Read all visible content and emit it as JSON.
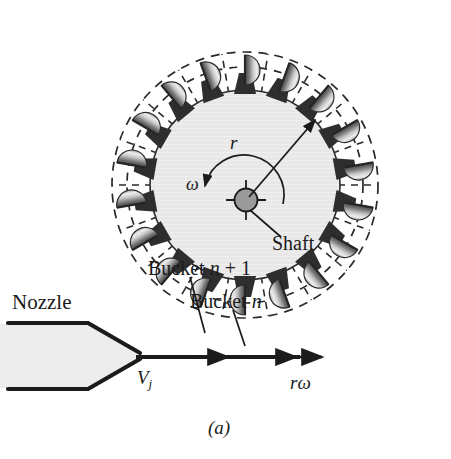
{
  "figure": {
    "caption": "(a)",
    "background_color": "#ffffff"
  },
  "labels": {
    "nozzle": "Nozzle",
    "bucket_n_plus_1": "Bucket n + 1",
    "bucket_n_plus_1_prefix": "Bucket ",
    "bucket_n_plus_1_var": "n",
    "bucket_n_plus_1_suffix": " + 1",
    "bucket_n": "Bucket n",
    "bucket_n_prefix": "Bucket ",
    "bucket_n_var": "n",
    "shaft": "Shaft",
    "radius": "r",
    "angular_velocity": "ω",
    "jet_velocity_symbol": "V",
    "jet_velocity_subscript": "j",
    "blade_speed": "rω"
  },
  "colors": {
    "disc_fill": "#e8e8e8",
    "disc_stroke": "#2a2a2a",
    "bucket_dark": "#3a3a3a",
    "bucket_light": "#f2f2f2",
    "bucket_stem": "#2e2e2e",
    "hub_fill": "#9a9a9a",
    "line": "#1b1b1b",
    "dashed": "#2a2a2a",
    "nozzle_fill": "#ececec",
    "text": "#1b1b1b"
  },
  "geometry": {
    "wheel_center_x": 245,
    "wheel_center_y": 185,
    "disc_radius": 95,
    "bucket_count": 18,
    "dashed_circle_inner_radius": 118,
    "dashed_circle_outer_radius": 133,
    "hub_radius": 11,
    "jet_line_y": 357
  }
}
